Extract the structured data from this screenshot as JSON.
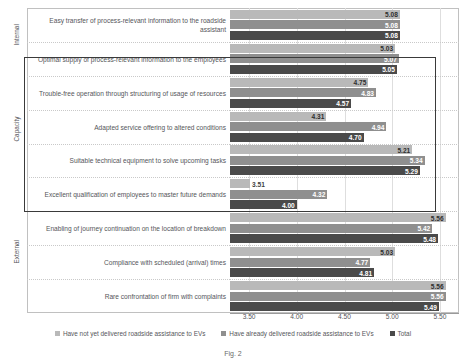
{
  "chart_data": {
    "type": "bar",
    "orientation": "horizontal",
    "title": "",
    "xlabel": "",
    "ylabel": "",
    "xlim": [
      3.3,
      5.7
    ],
    "xticks": [
      "3.50",
      "4.00",
      "4.50",
      "5.00",
      "5.50"
    ],
    "xtick_values": [
      3.5,
      4.0,
      4.5,
      5.0,
      5.5
    ],
    "grid": true,
    "legend_position": "bottom",
    "categories": [
      "Easy transfer of process-relevant information to the roadside assistant",
      "Optimal supply of process-relevant information to the employees",
      "Trouble-free operation through structuring of usage of resources",
      "Adapted service offering to altered conditions",
      "Suitable technical equipment to solve upcoming tasks",
      "Excellent qualification of employees to master future demands",
      "Enabling of journey continuation on the location of breakdown",
      "Compliance with scheduled (arrival) times",
      "Rare confrontation of firm with complaints"
    ],
    "series": [
      {
        "name": "Have not yet delivered roadside assistance to EVs",
        "color": "#b9b9b9",
        "values": [
          5.08,
          5.03,
          4.75,
          4.31,
          5.21,
          3.51,
          5.56,
          5.03,
          5.56
        ]
      },
      {
        "name": "Have already delivered roadside assistance to EVs",
        "color": "#8f8f8f",
        "values": [
          5.08,
          5.07,
          4.83,
          4.94,
          5.34,
          4.32,
          5.42,
          4.77,
          5.56
        ]
      },
      {
        "name": "Total",
        "color": "#4a4a4a",
        "values": [
          5.08,
          5.05,
          4.57,
          4.7,
          5.29,
          4.0,
          5.48,
          4.81,
          5.49
        ]
      }
    ],
    "group_labels": [
      {
        "label": "Internal",
        "start": 0,
        "end": 2
      },
      {
        "label": "Capacity",
        "start": 2,
        "end": 6
      },
      {
        "label": "External",
        "start": 6,
        "end": 9
      }
    ],
    "highlight": {
      "label": "Capacity highlight box",
      "start_category": 1,
      "end_category": 5,
      "color": "#3a3a3a"
    },
    "annotations": {
      "caption": "Fig. 2"
    }
  }
}
